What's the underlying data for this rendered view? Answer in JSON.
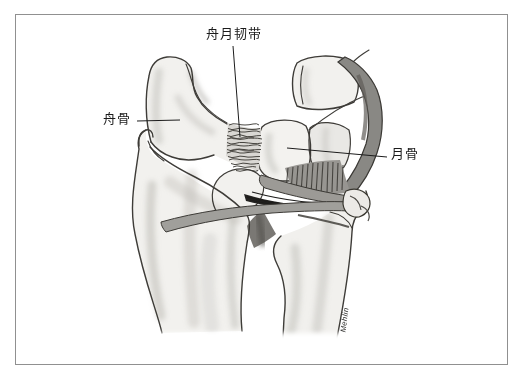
{
  "figure": {
    "type": "anatomical-illustration",
    "labels": {
      "ligament": "舟月韧带",
      "scaphoid": "舟骨",
      "lunate": "月骨"
    },
    "signature": "Mehlin",
    "colors": {
      "background": "#ffffff",
      "frame_border": "#909090",
      "outline": "#34322e",
      "bone_fill": "#f2f1ee",
      "pencil_shading": "#b9b7b2",
      "ligament_hatch": "#3a3833",
      "band_fill": "#9c9a96",
      "dark_fibers": "#232220",
      "capsule_band": "#898884",
      "label_text": "#1b1b1b"
    }
  }
}
